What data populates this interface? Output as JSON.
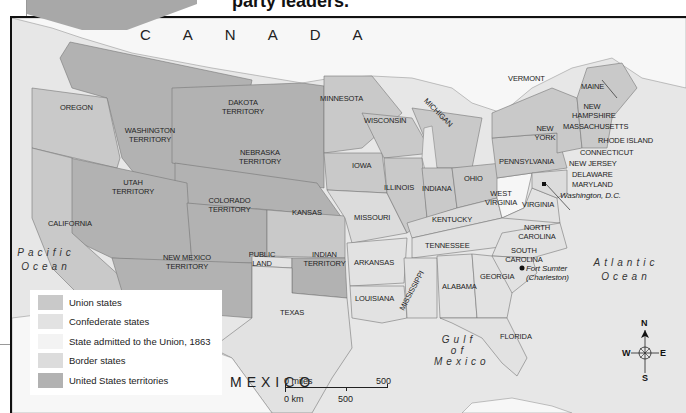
{
  "header": {
    "caption_fragment": "party leaders."
  },
  "map": {
    "title_countries": {
      "canada": "CANADA",
      "mexico": "MEXICO"
    },
    "oceans": {
      "pacific": [
        "Pacific",
        "Ocean"
      ],
      "atlantic": [
        "Atlantic",
        "Ocean"
      ],
      "gulf": [
        "Gulf",
        "of",
        "Mexico"
      ]
    },
    "regions": [
      {
        "name": "OREGON",
        "category": "union"
      },
      {
        "name": "WASHINGTON TERRITORY",
        "category": "territory"
      },
      {
        "name": "DAKOTA TERRITORY",
        "category": "territory"
      },
      {
        "name": "NEBRASKA TERRITORY",
        "category": "territory"
      },
      {
        "name": "UTAH TERRITORY",
        "category": "territory"
      },
      {
        "name": "COLORADO TERRITORY",
        "category": "territory"
      },
      {
        "name": "NEW MEXICO TERRITORY",
        "category": "territory"
      },
      {
        "name": "INDIAN TERRITORY",
        "category": "territory"
      },
      {
        "name": "CALIFORNIA",
        "category": "union"
      },
      {
        "name": "KANSAS",
        "category": "union"
      },
      {
        "name": "MINNESOTA",
        "category": "union"
      },
      {
        "name": "WISCONSIN",
        "category": "union"
      },
      {
        "name": "MICHIGAN",
        "category": "union"
      },
      {
        "name": "IOWA",
        "category": "union"
      },
      {
        "name": "ILLINOIS",
        "category": "union"
      },
      {
        "name": "INDIANA",
        "category": "union"
      },
      {
        "name": "OHIO",
        "category": "union"
      },
      {
        "name": "PENNSYLVANIA",
        "category": "union"
      },
      {
        "name": "NEW YORK",
        "category": "union"
      },
      {
        "name": "VERMONT",
        "category": "union"
      },
      {
        "name": "MAINE",
        "category": "union"
      },
      {
        "name": "NEW HAMPSHIRE",
        "category": "union"
      },
      {
        "name": "MASSACHUSETTS",
        "category": "union"
      },
      {
        "name": "RHODE ISLAND",
        "category": "union"
      },
      {
        "name": "CONNECTICUT",
        "category": "union"
      },
      {
        "name": "NEW JERSEY",
        "category": "union"
      },
      {
        "name": "DELAWARE",
        "category": "border"
      },
      {
        "name": "MARYLAND",
        "category": "border"
      },
      {
        "name": "WEST VIRGINIA",
        "category": "admitted_1863"
      },
      {
        "name": "MISSOURI",
        "category": "border"
      },
      {
        "name": "KENTUCKY",
        "category": "border"
      },
      {
        "name": "VIRGINIA",
        "category": "confederate"
      },
      {
        "name": "NORTH CAROLINA",
        "category": "confederate"
      },
      {
        "name": "SOUTH CAROLINA",
        "category": "confederate"
      },
      {
        "name": "GEORGIA",
        "category": "confederate"
      },
      {
        "name": "FLORIDA",
        "category": "confederate"
      },
      {
        "name": "ALABAMA",
        "category": "confederate"
      },
      {
        "name": "MISSISSIPPI",
        "category": "confederate"
      },
      {
        "name": "LOUISIANA",
        "category": "confederate"
      },
      {
        "name": "ARKANSAS",
        "category": "confederate"
      },
      {
        "name": "TENNESSEE",
        "category": "confederate"
      },
      {
        "name": "TEXAS",
        "category": "confederate"
      },
      {
        "name": "PUBLIC LAND",
        "category": "other"
      }
    ],
    "places": {
      "washington_dc": "Washington, D.C.",
      "fort_sumter": "Fort Sumter",
      "fort_sumter_sub": "(Charleston)"
    }
  },
  "legend": {
    "items": [
      {
        "label": "Union states",
        "color": "#c9c9c9"
      },
      {
        "label": "Confederate states",
        "color": "#e2e2e2"
      },
      {
        "label": "State admitted to the Union, 1863",
        "color": "#f6f6f6"
      },
      {
        "label": "Border states",
        "color": "#dcdcdc"
      },
      {
        "label": "United States territories",
        "color": "#b2b2b2"
      }
    ]
  },
  "scale_bar": {
    "miles_start": "0 miles",
    "miles_end": "500",
    "km_start": "0 km",
    "km_mid": "500"
  },
  "compass": {
    "n": "N",
    "s": "S",
    "e": "E",
    "w": "W"
  },
  "colors": {
    "union": "#c9c9c9",
    "confederate": "#e2e2e2",
    "admitted_1863": "#f6f6f6",
    "border": "#dcdcdc",
    "territory": "#b2b2b2",
    "foreign": "#f7f7f7",
    "water": "#e8e8e8"
  }
}
